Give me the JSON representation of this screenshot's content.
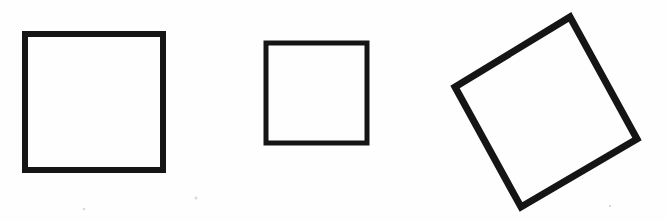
{
  "figure": {
    "title": "Three squares",
    "description": "Black outlined squares on a white background: two upright squares of different sizes and one large tilted square",
    "background_color": "#fefefe",
    "stroke_color": "#151515",
    "canvas": {
      "width": 667,
      "height": 221
    }
  },
  "chart_data": {
    "type": "scatter",
    "title": "Three squares",
    "xlabel": "",
    "ylabel": "",
    "xlim": [
      0,
      667
    ],
    "ylim": [
      221,
      0
    ],
    "grid": false,
    "legend": "none",
    "shapes": [
      {
        "name": "large-upright-square",
        "label": "Large square",
        "kind": "square",
        "rotation_deg": 0,
        "stroke_width": 6,
        "side_length": 142,
        "center": [
          94,
          102
        ],
        "bounds": {
          "x": 22,
          "y": 31,
          "width": 144,
          "height": 142
        },
        "vertices": [
          [
            25,
            34
          ],
          [
            163,
            34
          ],
          [
            163,
            170
          ],
          [
            25,
            170
          ]
        ]
      },
      {
        "name": "small-upright-square",
        "label": "Small square",
        "kind": "square",
        "rotation_deg": 0,
        "stroke_width": 5,
        "side_length": 104,
        "center": [
          316,
          93
        ],
        "bounds": {
          "x": 263,
          "y": 40,
          "width": 107,
          "height": 106
        },
        "vertices": [
          [
            266,
            43
          ],
          [
            367,
            43
          ],
          [
            367,
            143
          ],
          [
            266,
            143
          ]
        ]
      },
      {
        "name": "tilted-square",
        "label": "Tilted square",
        "kind": "square",
        "rotation_deg": 28,
        "stroke_width": 7,
        "side_length": 139,
        "center": [
          546,
          112
        ],
        "bounds": {
          "x": 450,
          "y": 13,
          "width": 191,
          "height": 199
        },
        "vertices": [
          [
            570,
            17
          ],
          [
            637,
            139
          ],
          [
            521,
            207
          ],
          [
            455,
            87
          ]
        ]
      }
    ],
    "specks": [
      {
        "x": 128,
        "y": 33,
        "r": 1.6
      },
      {
        "x": 196,
        "y": 198,
        "r": 1.5
      },
      {
        "x": 84,
        "y": 209,
        "r": 1.2
      },
      {
        "x": 610,
        "y": 206,
        "r": 1.2
      }
    ]
  }
}
